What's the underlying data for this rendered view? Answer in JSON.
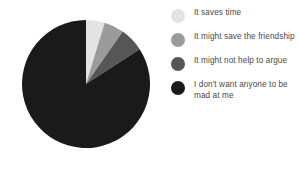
{
  "chart_data": {
    "type": "pie",
    "title": "",
    "subtitle": "",
    "xlabel": "",
    "ylabel": "",
    "grid": false,
    "legend_position": "right",
    "start_angle_deg": 0,
    "direction": "clockwise",
    "categories": [
      "It saves time",
      "It might save the friendship",
      "It might not help to argue",
      "I don't want anyone to be mad at me"
    ],
    "values": [
      4.7,
      5.0,
      6.1,
      84.2
    ],
    "angles_deg": [
      17,
      18,
      22,
      303
    ],
    "colors": [
      "#e3e3e3",
      "#9b9b9b",
      "#565656",
      "#1a1a1a"
    ],
    "slices": [
      {
        "label": "It saves time",
        "value": 4.7,
        "angle_deg": 17,
        "color": "#e3e3e3"
      },
      {
        "label": "It might save the friendship",
        "value": 5.0,
        "angle_deg": 18,
        "color": "#9b9b9b"
      },
      {
        "label": "It might not help to argue",
        "value": 6.1,
        "angle_deg": 22,
        "color": "#565656"
      },
      {
        "label": "I don't want anyone to be mad at me",
        "value": 84.2,
        "angle_deg": 303,
        "color": "#1a1a1a"
      }
    ]
  },
  "legend": {
    "items": [
      {
        "label": "It saves time",
        "color": "#e3e3e3"
      },
      {
        "label": "It might save the friendship",
        "color": "#9b9b9b"
      },
      {
        "label": "It might not help to argue",
        "color": "#565656"
      },
      {
        "label": "I don't want anyone to be mad at me",
        "color": "#1a1a1a"
      }
    ]
  }
}
